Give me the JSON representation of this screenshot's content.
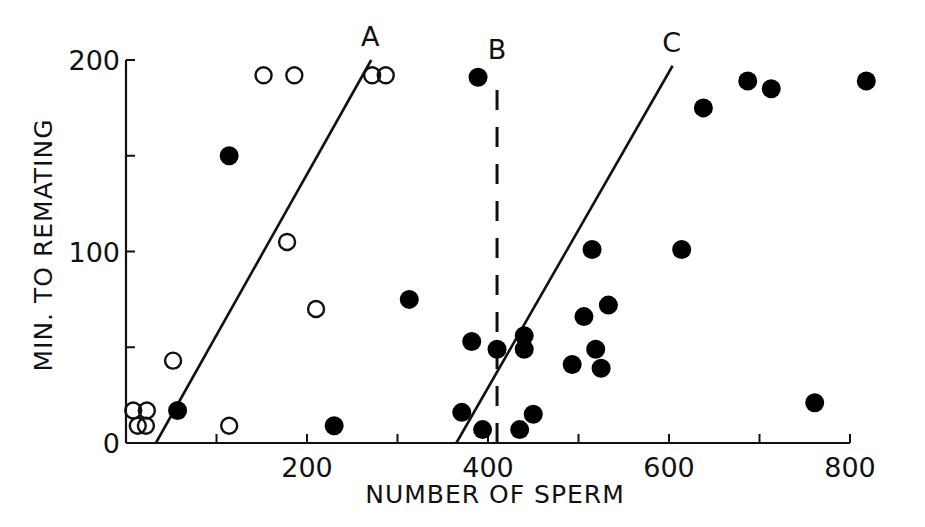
{
  "chart_data": {
    "type": "scatter",
    "title": "",
    "xlabel": "NUMBER OF SPERM",
    "ylabel": "MIN. TO REMATING",
    "xlim": [
      0,
      800
    ],
    "ylim": [
      0,
      200
    ],
    "x_ticks": [
      0,
      100,
      200,
      300,
      400,
      500,
      600,
      700,
      800
    ],
    "x_tick_labels": [
      "",
      "",
      "200",
      "",
      "400",
      "",
      "600",
      "",
      "800"
    ],
    "y_ticks": [
      0,
      50,
      100,
      150,
      200
    ],
    "y_tick_labels": [
      "0",
      "",
      "100",
      "",
      "200"
    ],
    "grid": false,
    "legend": null,
    "series": [
      {
        "name": "open circles",
        "marker": "open-circle",
        "points": [
          [
            8,
            17
          ],
          [
            23,
            17
          ],
          [
            13,
            9
          ],
          [
            22,
            9
          ],
          [
            52,
            43
          ],
          [
            114,
            9
          ],
          [
            178,
            105
          ],
          [
            210,
            70
          ],
          [
            152,
            192
          ],
          [
            186,
            192
          ],
          [
            272,
            192
          ],
          [
            287,
            192
          ]
        ]
      },
      {
        "name": "filled circles",
        "marker": "filled-circle",
        "points": [
          [
            57,
            17
          ],
          [
            114,
            150
          ],
          [
            230,
            9
          ],
          [
            313,
            75
          ],
          [
            389,
            191
          ],
          [
            371,
            16
          ],
          [
            382,
            53
          ],
          [
            394,
            7
          ],
          [
            410,
            49
          ],
          [
            435,
            7
          ],
          [
            440,
            56
          ],
          [
            440,
            49
          ],
          [
            450,
            15
          ],
          [
            493,
            41
          ],
          [
            506,
            66
          ],
          [
            519,
            49
          ],
          [
            515,
            101
          ],
          [
            525,
            39
          ],
          [
            533,
            72
          ],
          [
            614,
            101
          ],
          [
            638,
            175
          ],
          [
            687,
            189
          ],
          [
            713,
            185
          ],
          [
            818,
            189
          ],
          [
            761,
            21
          ]
        ]
      }
    ],
    "reference_lines": [
      {
        "label": "A",
        "style": "solid",
        "from": [
          33,
          0
        ],
        "to": [
          271,
          200
        ]
      },
      {
        "label": "B",
        "style": "dashed",
        "from": [
          410,
          0
        ],
        "to": [
          410,
          193
        ]
      },
      {
        "label": "C",
        "style": "solid",
        "from": [
          365,
          0
        ],
        "to": [
          604,
          197
        ]
      }
    ]
  }
}
